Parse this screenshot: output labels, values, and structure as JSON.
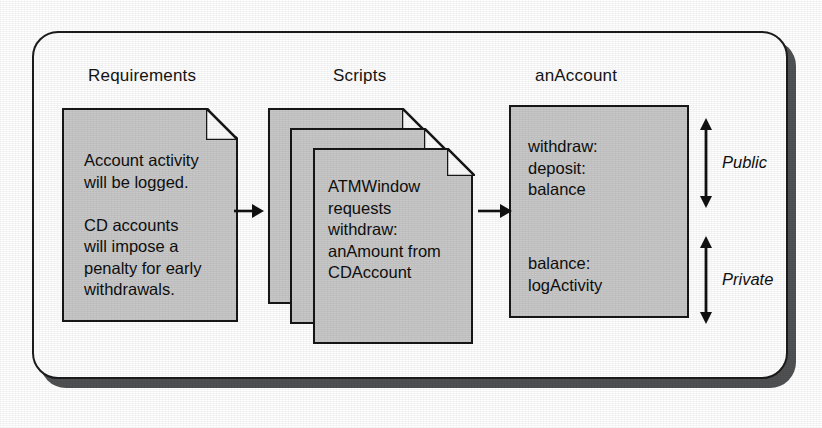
{
  "diagram": {
    "type": "flow-diagram",
    "panel": {
      "shape": "rounded-rectangle",
      "border_color": "#1c1c1c",
      "fill_color": "#fefefe",
      "shadow_color": "#4f5153"
    },
    "node_fill_color": "#c8c8c8",
    "headings": {
      "requirements": "Requirements",
      "scripts": "Scripts",
      "account": "anAccount"
    },
    "nodes": [
      {
        "id": "requirements",
        "heading": "Requirements",
        "shape": "document-dogear",
        "text": "Account activity\nwill be logged.\n\nCD accounts\nwill impose a\npenalty for early\nwithdrawals."
      },
      {
        "id": "scripts",
        "heading": "Scripts",
        "shape": "document-stack",
        "stack_count": 3,
        "text": "ATMWindow\nrequests\nwithdraw:\nanAmount from\nCDAccount"
      },
      {
        "id": "account",
        "heading": "anAccount",
        "shape": "rectangle",
        "public_members": "withdraw:\ndeposit:\nbalance",
        "private_members": "balance:\nlogActivity"
      }
    ],
    "connectors": [
      {
        "id": "requirements-to-scripts",
        "from": "requirements",
        "to": "scripts",
        "style": "single-arrow-right"
      },
      {
        "id": "scripts-to-account",
        "from": "scripts",
        "to": "account",
        "style": "single-arrow-right"
      }
    ],
    "brackets": [
      {
        "id": "public",
        "label": "Public",
        "style": "double-headed-arrow",
        "italic": true
      },
      {
        "id": "private",
        "label": "Private",
        "style": "double-headed-arrow",
        "italic": true
      }
    ]
  }
}
